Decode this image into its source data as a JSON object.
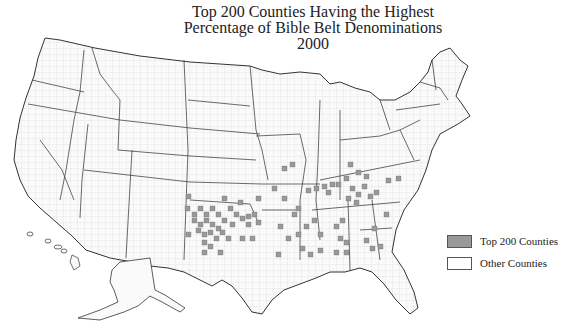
{
  "title": {
    "line1": "Top 200 Counties Having the Highest",
    "line2": "Percentage of Bible Belt Denominations",
    "line3": "2000"
  },
  "legend": {
    "items": [
      {
        "label": "Top 200 Counties",
        "color": "#999999"
      },
      {
        "label": "Other Counties",
        "color": "#ffffff"
      }
    ]
  },
  "colors": {
    "highlight": "#999999",
    "other": "#fafafa",
    "state_border": "#333333",
    "county_border": "#cccccc"
  }
}
